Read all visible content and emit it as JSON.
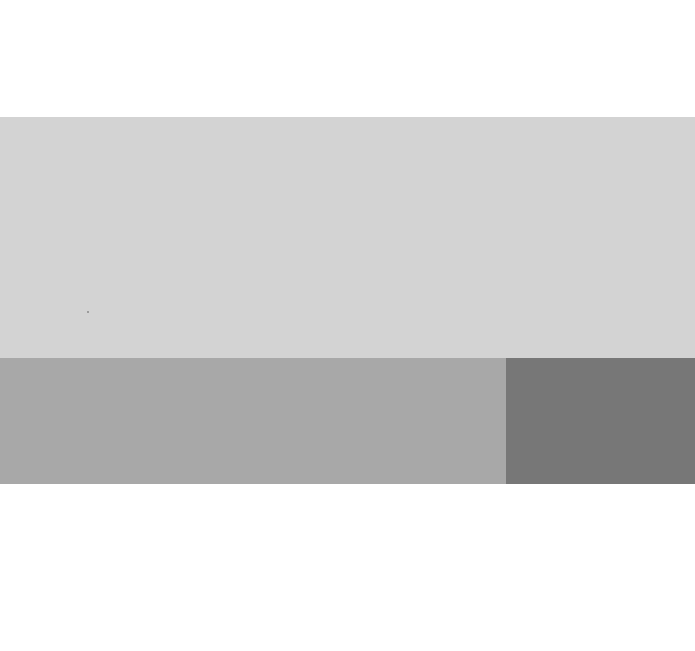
{
  "canvas": {
    "width": 695,
    "height": 651,
    "background": "#ffffff"
  },
  "swatches": [
    {
      "name": "light-gray",
      "color": "#d3d3d3",
      "x": 0,
      "y": 117,
      "width": 695,
      "height": 241
    },
    {
      "name": "mid-gray",
      "color": "#a8a8a8",
      "x": 0,
      "y": 358,
      "width": 506,
      "height": 126
    },
    {
      "name": "dark-gray",
      "color": "#777777",
      "x": 506,
      "y": 358,
      "width": 189,
      "height": 126
    }
  ]
}
